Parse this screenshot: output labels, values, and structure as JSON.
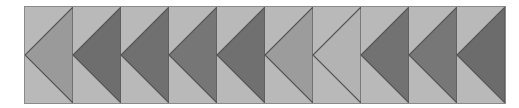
{
  "pattern": {
    "name": "flying geese strip",
    "orientation": "left-pointing",
    "block_count": 10,
    "background_color": "#b9b9b9",
    "outline_color": "#555555",
    "blocks": [
      {
        "index": 1,
        "triangle_color": "#9a9a9a"
      },
      {
        "index": 2,
        "triangle_color": "#6e6e6e"
      },
      {
        "index": 3,
        "triangle_color": "#707070"
      },
      {
        "index": 4,
        "triangle_color": "#767676"
      },
      {
        "index": 5,
        "triangle_color": "#707070"
      },
      {
        "index": 6,
        "triangle_color": "#9c9c9c"
      },
      {
        "index": 7,
        "triangle_color": "#b3b3b3"
      },
      {
        "index": 8,
        "triangle_color": "#727272"
      },
      {
        "index": 9,
        "triangle_color": "#777777"
      },
      {
        "index": 10,
        "triangle_color": "#6c6c6c"
      }
    ]
  }
}
